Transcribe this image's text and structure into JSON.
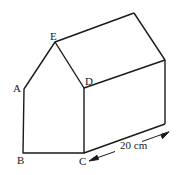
{
  "figure": {
    "labels": {
      "A": "A",
      "B": "B",
      "C": "C",
      "D": "D",
      "E": "E"
    },
    "dimension": {
      "length_label": "20 cm",
      "value": 20,
      "unit": "cm"
    },
    "colors": {
      "stroke": "#1a1a1a",
      "background": "#ffffff"
    }
  }
}
